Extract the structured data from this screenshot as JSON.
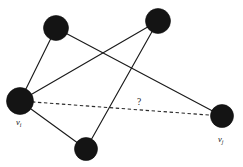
{
  "figure": {
    "background_color": "#ffffff",
    "node_color": "#141414",
    "edge_color": "#1a1a1a",
    "dashed_edge_color": "#2a2a2a",
    "width": 243,
    "height": 167
  },
  "nodes": [
    {
      "id": "n_top_left",
      "label": "",
      "sub": "",
      "cx": 56,
      "cy": 28,
      "r": 12.5
    },
    {
      "id": "n_top_right",
      "label": "",
      "sub": "",
      "cx": 158,
      "cy": 21,
      "r": 12.5
    },
    {
      "id": "v_i",
      "label": "v",
      "sub": "i",
      "cx": 20,
      "cy": 101,
      "r": 13.5
    },
    {
      "id": "n_bottom",
      "label": "",
      "sub": "",
      "cx": 86,
      "cy": 149,
      "r": 11.5
    },
    {
      "id": "v_j",
      "label": "v",
      "sub": "j",
      "cx": 222,
      "cy": 116,
      "r": 11.5
    }
  ],
  "labels": {
    "vi_text": "v",
    "vi_sub": "i",
    "vi_x": 16,
    "vi_y": 125,
    "vj_text": "v",
    "vj_sub": "j",
    "vj_x": 218,
    "vj_y": 142,
    "query_text": "?",
    "query_x": 137,
    "query_y": 105
  },
  "edges": [
    {
      "id": "e1",
      "from": "v_i",
      "to": "n_top_left",
      "x1": 20,
      "y1": 101,
      "x2": 56,
      "y2": 28,
      "style": "solid"
    },
    {
      "id": "e2",
      "from": "v_i",
      "to": "n_top_right",
      "x1": 20,
      "y1": 101,
      "x2": 158,
      "y2": 21,
      "style": "solid"
    },
    {
      "id": "e3",
      "from": "v_i",
      "to": "n_bottom",
      "x1": 20,
      "y1": 101,
      "x2": 86,
      "y2": 149,
      "style": "solid"
    },
    {
      "id": "e4",
      "from": "n_top_left",
      "to": "v_j",
      "x1": 56,
      "y1": 28,
      "x2": 222,
      "y2": 116,
      "style": "solid"
    },
    {
      "id": "e5",
      "from": "n_top_right",
      "to": "n_bottom",
      "x1": 158,
      "y1": 21,
      "x2": 86,
      "y2": 149,
      "style": "solid"
    },
    {
      "id": "e6",
      "from": "v_i",
      "to": "v_j",
      "x1": 20,
      "y1": 101,
      "x2": 222,
      "y2": 116,
      "style": "dashed"
    }
  ]
}
